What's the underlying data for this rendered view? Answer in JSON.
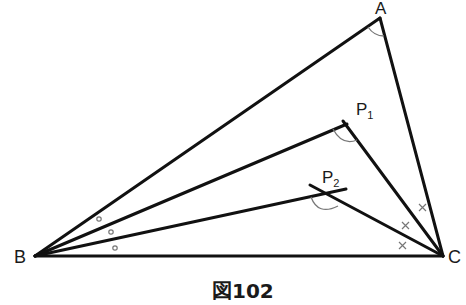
{
  "figure": {
    "caption": "図102",
    "vertices": {
      "A": {
        "label": "A",
        "x": 380,
        "y": 18
      },
      "B": {
        "label": "B",
        "x": 35,
        "y": 256
      },
      "C": {
        "label": "C",
        "x": 443,
        "y": 256
      }
    },
    "points": {
      "P1": {
        "label": "P",
        "sub": "1",
        "x": 345,
        "y": 126
      },
      "P2": {
        "label": "P",
        "sub": "2",
        "x": 330,
        "y": 193
      }
    },
    "angle_marks": {
      "B_bisect_mark": "○",
      "C_bisect_mark": "×"
    },
    "colors": {
      "line": "#111111",
      "mark": "#777777"
    }
  }
}
